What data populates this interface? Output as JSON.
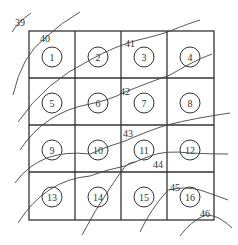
{
  "diagram": {
    "type": "contour-grid",
    "grid": {
      "rows": 4,
      "cols": 4
    },
    "cells": [
      "1",
      "2",
      "3",
      "4",
      "5",
      "6",
      "7",
      "8",
      "9",
      "10",
      "11",
      "12",
      "13",
      "14",
      "15",
      "16"
    ],
    "contours": [
      {
        "label": "39"
      },
      {
        "label": "40"
      },
      {
        "label": "41"
      },
      {
        "label": "42"
      },
      {
        "label": "43"
      },
      {
        "label": "44"
      },
      {
        "label": "45"
      },
      {
        "label": "46"
      }
    ],
    "colors": {
      "line": "#333333",
      "background": "#ffffff"
    }
  }
}
